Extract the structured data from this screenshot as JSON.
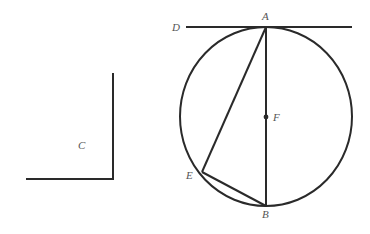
{
  "diagram": {
    "type": "geometry",
    "labels": {
      "A": "A",
      "B": "B",
      "C": "C",
      "D": "D",
      "E": "E",
      "F": "F"
    },
    "elements": [
      {
        "kind": "circle",
        "center": "F",
        "through": [
          "A",
          "B",
          "E"
        ]
      },
      {
        "kind": "tangent-line",
        "name": "DA",
        "touches": "A"
      },
      {
        "kind": "diameter",
        "from": "A",
        "to": "B",
        "through": "F"
      },
      {
        "kind": "segment",
        "from": "A",
        "to": "E"
      },
      {
        "kind": "segment",
        "from": "E",
        "to": "B"
      },
      {
        "kind": "right-angle",
        "name": "C"
      }
    ]
  }
}
